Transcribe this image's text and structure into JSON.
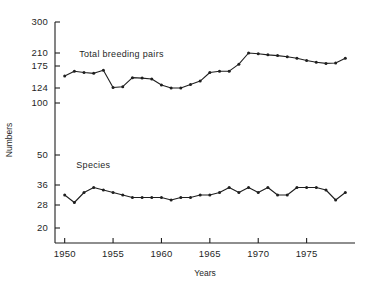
{
  "chart_data": {
    "type": "line",
    "title": "",
    "xlabel": "Years",
    "ylabel": "Numbers",
    "grid": false,
    "legend_position": "inline-annotation",
    "xlim": [
      1949,
      1980
    ],
    "x_ticks": [
      1950,
      1955,
      1960,
      1965,
      1970,
      1975
    ],
    "x_tick_labels": [
      "1950",
      "1955",
      "1960",
      "1965",
      "1970",
      "1975"
    ],
    "y_ticks": [
      20,
      28,
      36,
      50,
      100,
      124,
      175,
      210,
      300
    ],
    "y_tick_labels": [
      "20",
      "28",
      "36",
      "50",
      "100",
      "124",
      "175",
      "210",
      "300"
    ],
    "y_axis_note": "non-linear / broken value scale; tick spacing is uneven",
    "series": [
      {
        "name": "Total breeding pairs",
        "label_x": 1951.5,
        "label_y": 200,
        "x": [
          1950,
          1951,
          1952,
          1953,
          1954,
          1955,
          1956,
          1957,
          1958,
          1959,
          1960,
          1961,
          1962,
          1963,
          1964,
          1965,
          1966,
          1967,
          1968,
          1969,
          1970,
          1971,
          1972,
          1973,
          1974,
          1975,
          1976,
          1977,
          1978,
          1979
        ],
        "values": [
          152,
          163,
          160,
          158,
          165,
          125,
          127,
          148,
          147,
          145,
          131,
          124,
          124,
          132,
          140,
          160,
          163,
          163,
          180,
          210,
          208,
          205,
          203,
          200,
          196,
          190,
          185,
          182,
          183,
          196
        ]
      },
      {
        "name": "Species",
        "label_x": 1951.2,
        "label_y": 44,
        "x": [
          1950,
          1951,
          1952,
          1953,
          1954,
          1955,
          1956,
          1957,
          1958,
          1959,
          1960,
          1961,
          1962,
          1963,
          1964,
          1965,
          1966,
          1967,
          1968,
          1969,
          1970,
          1971,
          1972,
          1973,
          1974,
          1975,
          1976,
          1977,
          1978,
          1979
        ],
        "values": [
          32,
          29,
          33,
          35,
          34,
          33,
          32,
          31,
          31,
          31,
          31,
          30,
          31,
          31,
          32,
          32,
          33,
          35,
          33,
          35,
          33,
          35,
          32,
          32,
          35,
          35,
          35,
          34,
          30,
          33
        ]
      }
    ]
  }
}
